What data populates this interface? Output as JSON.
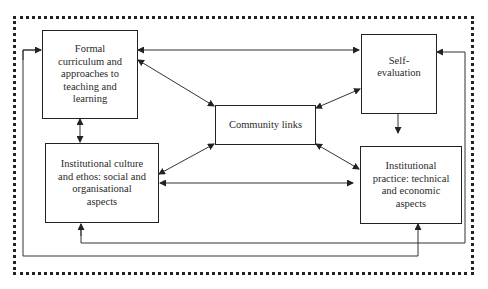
{
  "diagram": {
    "nodes": [
      {
        "id": "formal_curriculum",
        "label": "Formal curriculum and approaches to teaching and learning",
        "lines": [
          "Formal",
          "curriculum and",
          "approaches to",
          "teaching and",
          "learning"
        ]
      },
      {
        "id": "institutional_culture",
        "label": "Institutional culture and ethos: social and organisational aspects",
        "lines": [
          "Institutional culture",
          "and ethos: social and",
          "organisational",
          "aspects"
        ]
      },
      {
        "id": "community_links",
        "label": "Community links",
        "lines": [
          "Community links"
        ]
      },
      {
        "id": "self_evaluation",
        "label": "Self-evaluation",
        "lines": [
          "Self-",
          "evaluation"
        ]
      },
      {
        "id": "institutional_practice",
        "label": "Institutional practice: technical and economic aspects",
        "lines": [
          "Institutional",
          "practice: technical",
          "and economic",
          "aspects"
        ]
      }
    ],
    "edges": [
      {
        "from": "formal_curriculum",
        "to": "self_evaluation",
        "direction": "both"
      },
      {
        "from": "formal_curriculum",
        "to": "institutional_culture",
        "direction": "both"
      },
      {
        "from": "formal_curriculum",
        "to": "community_links",
        "direction": "both"
      },
      {
        "from": "community_links",
        "to": "self_evaluation",
        "direction": "both"
      },
      {
        "from": "community_links",
        "to": "institutional_culture",
        "direction": "both"
      },
      {
        "from": "community_links",
        "to": "institutional_practice",
        "direction": "both"
      },
      {
        "from": "institutional_culture",
        "to": "institutional_practice",
        "direction": "both"
      },
      {
        "from": "self_evaluation",
        "to": "institutional_practice",
        "direction": "forward"
      },
      {
        "from": "institutional_practice",
        "to": "formal_curriculum",
        "direction": "both",
        "route": "outer loop left/bottom"
      },
      {
        "from": "institutional_culture",
        "to": "self_evaluation",
        "direction": "both",
        "route": "outer loop bottom/right"
      }
    ],
    "frame": "dotted"
  }
}
